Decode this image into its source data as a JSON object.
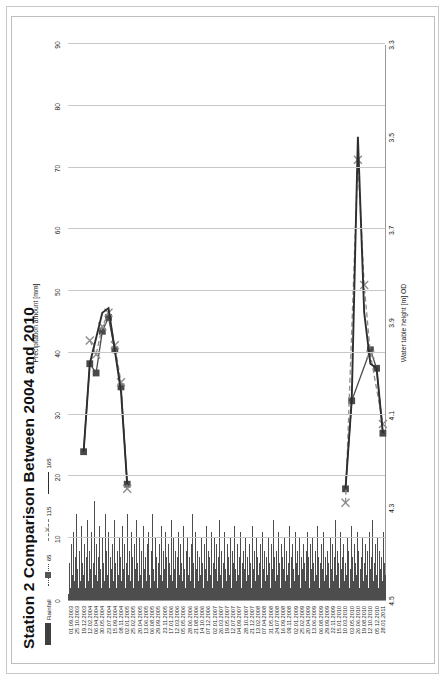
{
  "chart_data": {
    "type": "bar",
    "title": "Station 2 Comparison Between 2004 and 2010",
    "orientation": "horizontal-rotated",
    "xlabel_top": "Precipitation amount [mm]",
    "xlabel_bottom": "Water table height [m] OD",
    "top_axis": {
      "label": "Precipitation amount [mm]",
      "ticks": [
        "0",
        "10",
        "20",
        "30",
        "40",
        "50",
        "60",
        "70",
        "80",
        "90"
      ],
      "min": 0,
      "max": 90
    },
    "bottom_axis": {
      "label": "Water table height [m] OD",
      "ticks": [
        "4.5",
        "4.3",
        "4.1",
        "3.9",
        "3.7",
        "3.5",
        "3.3"
      ],
      "min": 3.3,
      "max": 4.5,
      "reversed": true
    },
    "legend": {
      "position": "top-left",
      "entries": [
        {
          "label": "Rainfall",
          "marker": "bar",
          "color": "#3f3f3f"
        },
        {
          "label": "65",
          "marker": "square-dotted",
          "color": "#555555"
        },
        {
          "label": "115",
          "marker": "x-dashed",
          "color": "#8d8d8d"
        },
        {
          "label": "165",
          "marker": "line",
          "color": "#2e2e2e"
        }
      ]
    },
    "categories": [
      "01.09.2003",
      "25.10.2003",
      "19.12.2003",
      "12.02.2004",
      "06.04.2004",
      "30.05.2004",
      "23.07.2004",
      "15.09.2004",
      "08.11.2004",
      "02.01.2005",
      "25.02.2005",
      "20.04.2005",
      "13.06.2005",
      "06.08.2005",
      "29.09.2005",
      "23.11.2005",
      "17.01.2006",
      "12.03.2006",
      "05.05.2006",
      "28.06.2006",
      "21.08.2006",
      "14.10.2006",
      "07.12.2006",
      "02.01.2007",
      "26.03.2007",
      "19.05.2007",
      "12.07.2007",
      "04.09.2007",
      "28.10.2007",
      "21.12.2007",
      "13.02.2008",
      "07.04.2008",
      "31.05.2008",
      "24.07.2008",
      "16.09.2008",
      "09.11.2008",
      "02.01.2009",
      "25.02.2009",
      "20.04.2009",
      "13.06.2009",
      "06.08.2009",
      "29.09.2009",
      "22.11.2009",
      "15.01.2010",
      "10.03.2010",
      "03.05.2010",
      "26.06.2010",
      "19.08.2010",
      "12.10.2010",
      "05.12.2010",
      "28.01.2011"
    ],
    "rainfall_series": {
      "name": "Rainfall",
      "unit": "mm",
      "note": "Daily rainfall spikes, 0-22 mm typical, plotted against top axis",
      "values": [
        1,
        6,
        2,
        9,
        4,
        11,
        3,
        7,
        14,
        5,
        2,
        8,
        3,
        12,
        6,
        4,
        9,
        2,
        7,
        13,
        3,
        8,
        5,
        11,
        2,
        6,
        16,
        4,
        9,
        3,
        7,
        12,
        5,
        2,
        10,
        6,
        3,
        14,
        8,
        4,
        11,
        2,
        7,
        5,
        9,
        3,
        13,
        6,
        2,
        8,
        4,
        10,
        7,
        3,
        12,
        5,
        9,
        2,
        6,
        14,
        4,
        8,
        3,
        11,
        7,
        2,
        9,
        5,
        13,
        6,
        3,
        10,
        4,
        8,
        2,
        12,
        5,
        7,
        3,
        9,
        6,
        11,
        4,
        2,
        8,
        14,
        5,
        3,
        10,
        7,
        2,
        6,
        9,
        4,
        12,
        3,
        8,
        5,
        11,
        7,
        2,
        9,
        6,
        4,
        13,
        3,
        10,
        5,
        8,
        2,
        7,
        11,
        4,
        9,
        6,
        3,
        12,
        5,
        2,
        8,
        10,
        4,
        7,
        3,
        9,
        14,
        6,
        2,
        11,
        5,
        8,
        3,
        7,
        4,
        10,
        6,
        2,
        9,
        5,
        12,
        3,
        8,
        7,
        4,
        11,
        2,
        6,
        10,
        5,
        9,
        3,
        7,
        13,
        4,
        8,
        2,
        6,
        11,
        5,
        3,
        9,
        7,
        4,
        10,
        2,
        8,
        6,
        12,
        5,
        3,
        9,
        4,
        7,
        11,
        2,
        6,
        8,
        5,
        10,
        3,
        7,
        4,
        9,
        6,
        2,
        12,
        5,
        8,
        3,
        10,
        7,
        4,
        6,
        9,
        2,
        11,
        5,
        8,
        3,
        7,
        4,
        10,
        6,
        2,
        9,
        5,
        13,
        7,
        3,
        8,
        4,
        11,
        6,
        2,
        9,
        7,
        5,
        10,
        3,
        8,
        4,
        6,
        12,
        2,
        7,
        9,
        5,
        3,
        11,
        6,
        8,
        4,
        10,
        2,
        7,
        5,
        9,
        6,
        3,
        8,
        11,
        4,
        7,
        2,
        9,
        5,
        10,
        6,
        3,
        8,
        4,
        12,
        7,
        2,
        6,
        9,
        5,
        11,
        3,
        7,
        4,
        8,
        6,
        2,
        10,
        5,
        9,
        3,
        7,
        13,
        4,
        8,
        6,
        2,
        11,
        5,
        7,
        9,
        3,
        6,
        4,
        10,
        8,
        2,
        5,
        12,
        7,
        3,
        9,
        6,
        4,
        11,
        8,
        2,
        5,
        7,
        10,
        3,
        6,
        9,
        4,
        8,
        2,
        11,
        5,
        7,
        13,
        3,
        6,
        9,
        4,
        10,
        2,
        8,
        5,
        7,
        3,
        11,
        6,
        4
      ]
    },
    "depth_series": [
      {
        "name": "65",
        "marker": "square",
        "style": "solid",
        "color": "#4a4a4a",
        "points": [
          {
            "date": "19.12.2003",
            "water_table": 4.18
          },
          {
            "date": "12.02.2004",
            "water_table": 3.99
          },
          {
            "date": "06.04.2004",
            "water_table": 4.01
          },
          {
            "date": "30.05.2004",
            "water_table": 3.92
          },
          {
            "date": "23.07.2004",
            "water_table": 3.89
          },
          {
            "date": "15.09.2004",
            "water_table": 3.96
          },
          {
            "date": "08.11.2004",
            "water_table": 4.04
          },
          {
            "date": "02.01.2005",
            "water_table": 4.25
          },
          {
            "date": "10.03.2010",
            "water_table": 4.26
          },
          {
            "date": "03.05.2010",
            "water_table": 4.07
          },
          {
            "date": "12.10.2010",
            "water_table": 3.96
          },
          {
            "date": "05.12.2010",
            "water_table": 4.0
          },
          {
            "date": "28.01.2011",
            "water_table": 4.14
          }
        ]
      },
      {
        "name": "115",
        "marker": "x",
        "style": "dashed",
        "color": "#8d8d8d",
        "points": [
          {
            "date": "12.02.2004",
            "water_table": 3.94
          },
          {
            "date": "06.04.2004",
            "water_table": 3.97
          },
          {
            "date": "30.05.2004",
            "water_table": 3.91
          },
          {
            "date": "23.07.2004",
            "water_table": 3.88
          },
          {
            "date": "15.09.2004",
            "water_table": 3.95
          },
          {
            "date": "08.11.2004",
            "water_table": 4.03
          },
          {
            "date": "02.01.2005",
            "water_table": 4.26
          },
          {
            "date": "10.03.2010",
            "water_table": 4.29
          },
          {
            "date": "26.06.2010",
            "water_table": 3.55
          },
          {
            "date": "19.08.2010",
            "water_table": 3.82
          },
          {
            "date": "12.10.2010",
            "water_table": 3.97
          },
          {
            "date": "28.01.2011",
            "water_table": 4.12
          }
        ]
      },
      {
        "name": "165",
        "marker": "line",
        "style": "solid",
        "color": "#2e2e2e",
        "points": [
          {
            "date": "19.12.2003",
            "water_table": 4.18
          },
          {
            "date": "12.02.2004",
            "water_table": 3.99
          },
          {
            "date": "30.05.2004",
            "water_table": 3.88
          },
          {
            "date": "23.07.2004",
            "water_table": 3.87
          },
          {
            "date": "08.11.2004",
            "water_table": 4.05
          },
          {
            "date": "02.01.2005",
            "water_table": 4.25
          },
          {
            "date": "10.03.2010",
            "water_table": 4.26
          },
          {
            "date": "03.05.2010",
            "water_table": 4.07
          },
          {
            "date": "26.06.2010",
            "water_table": 3.5
          },
          {
            "date": "19.08.2010",
            "water_table": 3.88
          },
          {
            "date": "12.10.2010",
            "water_table": 3.99
          },
          {
            "date": "05.12.2010",
            "water_table": 4.0
          },
          {
            "date": "28.01.2011",
            "water_table": 4.14
          }
        ]
      }
    ]
  }
}
